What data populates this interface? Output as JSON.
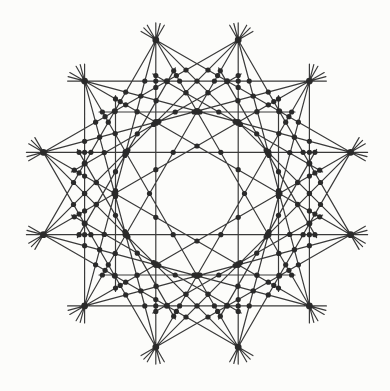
{
  "canvas": {
    "width": 390,
    "height": 391,
    "background": "#fcfcfa"
  },
  "figure": {
    "description_name": "twelve-fold-star-line-arrangement",
    "center_x": 197,
    "center_y": 193.5,
    "radius": 159,
    "vertex_count": 12,
    "vertex_angle_start_deg": 15,
    "vertex_angle_step_deg": 30,
    "chord_steps": [
      3,
      4,
      5
    ],
    "chord_overshoot": 17,
    "aux_family": {
      "count": 12,
      "normal_angle_start_deg": 0,
      "normal_angle_step_deg": 30,
      "distance_from_center": 81.5,
      "half_length": 95,
      "overshoot": 3
    },
    "line_color": "#3a3a3a",
    "line_width": 1.2,
    "dot_color": "#2a2a2a",
    "dot_radius_major": 3.4,
    "dot_radius_medium": 3.0,
    "dot_radius_minor": 2.7,
    "dot_radius_ring": 2.6,
    "cluster_tolerance": 2.4,
    "min_concurrent_lines": 3,
    "ring_dot_windows": [
      [
        109,
        126
      ],
      [
        77,
        87
      ],
      [
        44,
        51
      ]
    ]
  }
}
